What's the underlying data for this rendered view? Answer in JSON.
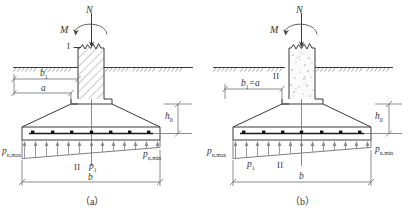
{
  "figures": [
    {
      "key": "a",
      "caption": "（a）",
      "labels": {
        "axial_load": "N",
        "moment": "M",
        "section_top": "I",
        "section_bottom": "II",
        "width_b1": "b",
        "width_b1_sub": "1",
        "width_a": "a",
        "depth_h0": "h",
        "depth_h0_sub": "0",
        "p_max": "p",
        "p_max_sub": "n,max",
        "p_min": "p",
        "p_min_sub": "n,min",
        "p_one": "p",
        "p_one_sub": "1",
        "base_width": "b"
      }
    },
    {
      "key": "b",
      "caption": "（b）",
      "labels": {
        "axial_load": "N",
        "moment": "M",
        "section_top": "II",
        "section_bottom": "II",
        "width_b1_eq_a": "b",
        "width_b1_eq_a_sub": "1",
        "width_b1_eq_a_tail": "=a",
        "depth_h0": "h",
        "depth_h0_sub": "0",
        "p_max": "p",
        "p_max_sub": "n,max",
        "p_min": "p",
        "p_min_sub": "n,min",
        "p_one": "p",
        "p_one_sub": "1",
        "base_width": "b"
      }
    }
  ],
  "icons": {
    "load_arrow": "downward-arrow",
    "moment_arrow": "curved-moment-arrow",
    "pressure_arrow": "upward-arrow",
    "ground_hatch": "ground-hatch",
    "rebar_dot": "rebar-dot"
  },
  "colors": {
    "line": "#3a3a3a",
    "thin": "#6f6f6f",
    "rebar": "#1a1a1a",
    "text": "#343434"
  }
}
